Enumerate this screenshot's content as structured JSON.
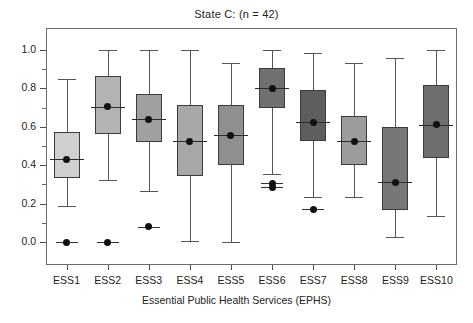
{
  "chart_data": {
    "type": "box",
    "title": "State C: (n = 42)",
    "xlabel": "Essential Public Health Services (EPHS)",
    "ylabel": "",
    "ylim": [
      0.0,
      1.0
    ],
    "ytick_labels": [
      "0.0",
      "0.2",
      "0.4",
      "0.6",
      "0.8",
      "1.0"
    ],
    "ytick_values": [
      0.0,
      0.2,
      0.4,
      0.6,
      0.8,
      1.0
    ],
    "yminor_values": [
      0.1,
      0.3,
      0.5,
      0.7,
      0.9
    ],
    "grid": false,
    "legend": "none",
    "categories": [
      "ESS1",
      "ESS2",
      "ESS3",
      "ESS4",
      "ESS5",
      "ESS6",
      "ESS7",
      "ESS8",
      "ESS9",
      "ESS10"
    ],
    "boxes": [
      {
        "category": "ESS1",
        "whisker_low": 0.19,
        "q1": 0.335,
        "median": 0.43,
        "q3": 0.575,
        "whisker_high": 0.85,
        "mean": 0.43,
        "outliers": [
          0.0
        ],
        "fill": "#cfcfcf"
      },
      {
        "category": "ESS2",
        "whisker_low": 0.325,
        "q1": 0.565,
        "median": 0.705,
        "q3": 0.865,
        "whisker_high": 1.0,
        "mean": 0.705,
        "outliers": [
          0.0
        ],
        "fill": "#b3b3b3"
      },
      {
        "category": "ESS3",
        "whisker_low": 0.265,
        "q1": 0.52,
        "median": 0.64,
        "q3": 0.77,
        "whisker_high": 1.0,
        "mean": 0.64,
        "outliers": [
          0.08
        ],
        "fill": "#a0a0a0"
      },
      {
        "category": "ESS4",
        "whisker_low": 0.005,
        "q1": 0.345,
        "median": 0.525,
        "q3": 0.715,
        "whisker_high": 1.0,
        "mean": 0.525,
        "outliers": [],
        "fill": "#a8a8a8"
      },
      {
        "category": "ESS5",
        "whisker_low": 0.0,
        "q1": 0.4,
        "median": 0.555,
        "q3": 0.715,
        "whisker_high": 0.93,
        "mean": 0.555,
        "outliers": [],
        "fill": "#8f8f8f"
      },
      {
        "category": "ESS6",
        "whisker_low": 0.355,
        "q1": 0.7,
        "median": 0.8,
        "q3": 0.905,
        "whisker_high": 1.0,
        "mean": 0.8,
        "outliers": [
          0.305,
          0.285
        ],
        "fill": "#707070"
      },
      {
        "category": "ESS7",
        "whisker_low": 0.235,
        "q1": 0.525,
        "median": 0.625,
        "q3": 0.79,
        "whisker_high": 0.985,
        "mean": 0.625,
        "outliers": [
          0.17
        ],
        "fill": "#5e5e5e"
      },
      {
        "category": "ESS8",
        "whisker_low": 0.235,
        "q1": 0.4,
        "median": 0.525,
        "q3": 0.655,
        "whisker_high": 0.93,
        "mean": 0.525,
        "outliers": [],
        "fill": "#9c9c9c"
      },
      {
        "category": "ESS9",
        "whisker_low": 0.025,
        "q1": 0.165,
        "median": 0.31,
        "q3": 0.6,
        "whisker_high": 0.96,
        "mean": 0.31,
        "outliers": [],
        "fill": "#777777"
      },
      {
        "category": "ESS10",
        "whisker_low": 0.135,
        "q1": 0.435,
        "median": 0.61,
        "q3": 0.82,
        "whisker_high": 1.0,
        "mean": 0.61,
        "outliers": [],
        "fill": "#6e6e6e"
      }
    ]
  },
  "axis": {
    "frame_color": "#6d6d6d",
    "tick_color": "#4a4a4a"
  }
}
